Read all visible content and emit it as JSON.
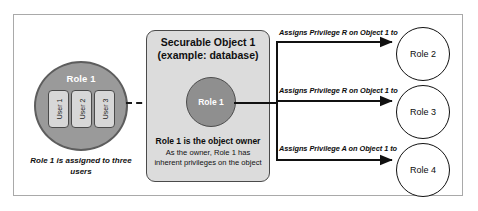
{
  "diagram": {
    "left_group": {
      "role_label": "Role 1",
      "users": [
        "User 1",
        "User 2",
        "User 3"
      ],
      "caption": "Role 1 is assigned to three users"
    },
    "object_box": {
      "title_line_1": "Securable Object 1",
      "title_line_2": "(example: database)",
      "inner_role_label": "Role 1",
      "owner_title": "Role 1 is the object owner",
      "owner_desc_line_1": "As the owner, Role 1 has",
      "owner_desc_line_2": "inherent privileges on the object"
    },
    "arrows": [
      {
        "label": "Assigns Privilege R on Object 1 to",
        "target": "Role 2"
      },
      {
        "label": "Assigns Privilege R on Object 1 to",
        "target": "Role 3"
      },
      {
        "label": "Assigns Privilege A on Object 1 to",
        "target": "Role 4"
      }
    ],
    "right_roles": [
      "Role 2",
      "Role 3",
      "Role 4"
    ],
    "colors": {
      "frame_border": "#a9a9a9",
      "left_role_fill": "#9a9a9a",
      "left_role_stroke": "#5d5d5d",
      "user_box_fill": "#d7d7d7",
      "user_box_stroke": "#4a4a4a",
      "object_box_fill": "#dcdcdc",
      "object_box_stroke": "#4a4a4a",
      "object_role_fill": "#8f8f8f",
      "arrow_stroke": "#111111",
      "right_role_fill": "#ffffff",
      "right_role_stroke": "#111111",
      "text": "#0d0d0d"
    }
  }
}
